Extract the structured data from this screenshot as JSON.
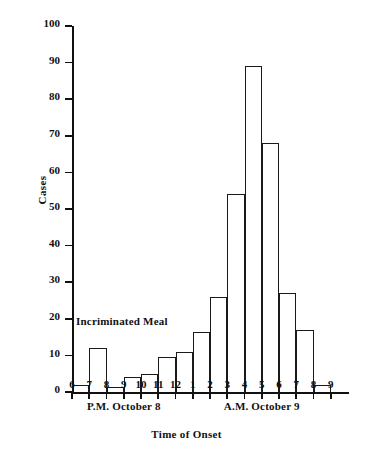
{
  "chart_data": {
    "type": "bar",
    "title": "",
    "xlabel": "Time of Onset",
    "ylabel": "Cases",
    "ylim": [
      0,
      100
    ],
    "yticks": [
      0,
      10,
      20,
      30,
      40,
      50,
      60,
      70,
      80,
      90,
      100
    ],
    "ytick_labels": [
      "0",
      "10",
      "20",
      "30",
      "40",
      "50",
      "60",
      "70",
      "80",
      "90",
      "100"
    ],
    "grid": false,
    "legend": null,
    "categories": [
      "6",
      "7",
      "8",
      "9",
      "10",
      "11",
      "12",
      "1",
      "2",
      "3",
      "4",
      "5",
      "6",
      "7",
      "8"
    ],
    "xtick_labels": [
      "6",
      "7",
      "8",
      "9",
      "10",
      "11",
      "12",
      "1",
      "2",
      "3",
      "4",
      "5",
      "6",
      "7",
      "8",
      "9"
    ],
    "values": [
      2,
      12,
      1.5,
      4,
      5,
      9.5,
      11,
      16.5,
      26,
      54,
      89,
      68,
      27,
      17,
      2
    ],
    "annotations": [
      {
        "text": "Incriminated Meal",
        "x_hour": "6",
        "y_value": 19
      }
    ],
    "group_labels": [
      {
        "text": "P.M. October 8",
        "span": [
          "6",
          "12"
        ]
      },
      {
        "text": "A.M. October 9",
        "span": [
          "1",
          "9"
        ]
      }
    ]
  },
  "axis": {
    "y_title": "Cases",
    "x_title": "Time of Onset"
  },
  "colors": {
    "bar_stroke": "#1a1a1a",
    "bar_fill": "#ffffff",
    "axis": "#111111",
    "text": "#111111",
    "background": "#ffffff"
  }
}
